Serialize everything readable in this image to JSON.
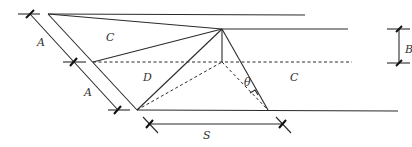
{
  "diagram": {
    "labels": {
      "region_upper_left": "C",
      "region_middle": "D",
      "region_right": "C",
      "dim_A_upper": "A",
      "dim_A_lower": "A",
      "dim_B": "B",
      "dim_S": "S",
      "angle": "θ"
    },
    "colors": {
      "line": "#2b2b2b",
      "background": "#ffffff"
    }
  }
}
